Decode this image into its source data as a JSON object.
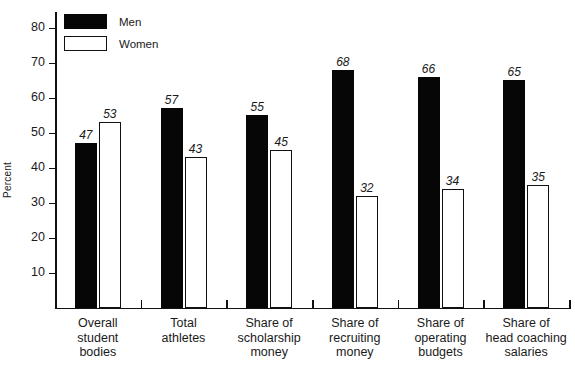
{
  "chart_data": {
    "type": "bar",
    "title": "",
    "xlabel": "",
    "ylabel": "Percent",
    "ylim": [
      0,
      85
    ],
    "ytick_values": [
      10,
      20,
      30,
      40,
      50,
      60,
      70,
      80
    ],
    "ytick_labels": [
      "10",
      "20",
      "30",
      "40",
      "50",
      "60",
      "70",
      "80"
    ],
    "grid": false,
    "legend_position": "top-left",
    "categories": [
      "Overall\nstudent\nbodies",
      "Total\nathletes",
      "Share of\nscholarship\nmoney",
      "Share of\nrecruiting\nmoney",
      "Share of\noperating\nbudgets",
      "Share of\nhead coaching\nsalaries"
    ],
    "series": [
      {
        "name": "Men",
        "color": "#060606",
        "values": [
          47,
          57,
          55,
          68,
          66,
          65
        ],
        "labels": [
          "47",
          "57",
          "55",
          "68",
          "66",
          "65"
        ]
      },
      {
        "name": "Women",
        "color": "#ffffff",
        "values": [
          53,
          43,
          45,
          32,
          34,
          35
        ],
        "labels": [
          "53",
          "43",
          "45",
          "32",
          "34",
          "35"
        ]
      }
    ]
  },
  "legend": {
    "items": [
      {
        "label": "Men"
      },
      {
        "label": "Women"
      }
    ]
  }
}
